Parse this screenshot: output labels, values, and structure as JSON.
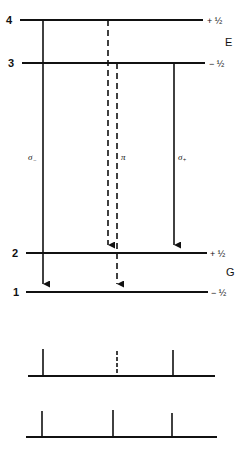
{
  "diagram": {
    "upper_group_label": "E",
    "lower_group_label": "G",
    "levels": [
      {
        "id": "4",
        "label": "4",
        "mj": "+ ½",
        "y": 20,
        "x1": 20,
        "x2": 203
      },
      {
        "id": "3",
        "label": "3",
        "mj": "− ½",
        "y": 63,
        "x1": 22,
        "x2": 205
      },
      {
        "id": "2",
        "label": "2",
        "mj": "+ ½",
        "y": 253,
        "x1": 26,
        "x2": 207
      },
      {
        "id": "1",
        "label": "1",
        "mj": "− ½",
        "y": 292,
        "x1": 26,
        "x2": 208
      }
    ],
    "transitions": [
      {
        "name": "sigma-minus",
        "label": "σ₋",
        "from": "4",
        "to": "1",
        "style": "solid",
        "x": 43
      },
      {
        "name": "pi-4-2",
        "label": "π",
        "from": "4",
        "to": "2",
        "style": "dashed",
        "x": 108
      },
      {
        "name": "pi-3-1",
        "label": "",
        "from": "3",
        "to": "1",
        "style": "dashed",
        "x": 117
      },
      {
        "name": "sigma-plus",
        "label": "σ₊",
        "from": "3",
        "to": "2",
        "style": "solid",
        "x": 174
      }
    ],
    "transition_labels": {
      "sigma_minus": "σ",
      "sigma_minus_sub": "−",
      "pi": "π",
      "sigma_plus": "σ",
      "sigma_plus_sub": "+"
    },
    "spectra": [
      {
        "name": "spectrum-top",
        "baseline_y": 376,
        "x1": 28,
        "x2": 215,
        "lines": [
          {
            "x": 43,
            "top": 349,
            "style": "solid"
          },
          {
            "x": 117,
            "top": 351,
            "style": "dashed"
          },
          {
            "x": 173,
            "top": 350,
            "style": "solid"
          }
        ]
      },
      {
        "name": "spectrum-bottom",
        "baseline_y": 437,
        "x1": 26,
        "x2": 217,
        "lines": [
          {
            "x": 42,
            "top": 411,
            "style": "solid"
          },
          {
            "x": 113,
            "top": 410,
            "style": "solid"
          },
          {
            "x": 172,
            "top": 413,
            "style": "solid"
          }
        ]
      }
    ]
  }
}
